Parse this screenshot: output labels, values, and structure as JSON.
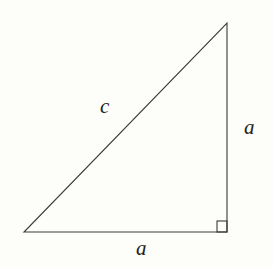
{
  "diagram": {
    "type": "right-triangle",
    "vertices": {
      "bottom_left": [
        24,
        232
      ],
      "bottom_right": [
        227,
        232
      ],
      "top_right": [
        227,
        23
      ]
    },
    "right_angle_marker": {
      "x": 217,
      "y": 221,
      "size": 10
    },
    "labels": {
      "hypotenuse": "c",
      "vertical_leg": "a",
      "horizontal_leg": "a"
    },
    "colors": {
      "stroke": "#3a3a3a",
      "text": "#222222",
      "background": "#fdfdf9"
    }
  }
}
